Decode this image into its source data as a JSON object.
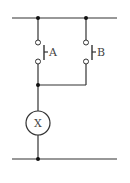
{
  "diagram": {
    "type": "ladder-circuit",
    "rails": {
      "top": {
        "y": 18,
        "x1": 12,
        "x2": 117
      },
      "bottom": {
        "y": 159,
        "x1": 12,
        "x2": 117
      }
    },
    "switches": [
      {
        "label": "A",
        "type": "normally-open pushbutton",
        "x": 38
      },
      {
        "label": "B",
        "type": "normally-open pushbutton",
        "x": 86
      }
    ],
    "load": {
      "label": "X",
      "type": "lamp/relay coil",
      "cx": 38,
      "cy": 123,
      "r": 12
    },
    "connection": "A and B in parallel, in series with X"
  }
}
